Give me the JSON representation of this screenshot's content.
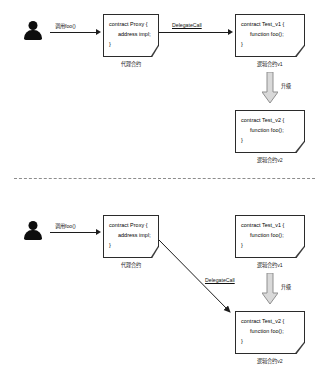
{
  "diagram": {
    "divider_label": "dashed-separator"
  },
  "panel_before": {
    "actor": {
      "name": "user-actor"
    },
    "call_label": "调用foo()",
    "proxy_box": {
      "line1": "contract Proxy {",
      "line2": "address impl;",
      "line3": "}",
      "caption": "代理合约"
    },
    "delegate_label": "DelegateCall",
    "logic_v1_box": {
      "line1": "contract Test_v1 {",
      "line2": "function foo();",
      "line3": "}",
      "caption": "逻辑合约v1"
    },
    "upgrade_label": "升级",
    "logic_v2_box": {
      "line1": "contract Test_v2 {",
      "line2": "function foo();",
      "line3": "}",
      "caption": "逻辑合约v2"
    }
  },
  "panel_after": {
    "actor": {
      "name": "user-actor"
    },
    "call_label": "调用foo()",
    "proxy_box": {
      "line1": "contract Proxy {",
      "line2": "address impl;",
      "line3": "}",
      "caption": "代理合约"
    },
    "delegate_label": "DelegateCall",
    "logic_v1_box": {
      "line1": "contract Test_v1 {",
      "line2": "function foo();",
      "line3": "}",
      "caption": "逻辑合约v1"
    },
    "upgrade_label": "升级",
    "logic_v2_box": {
      "line1": "contract Test_v2 {",
      "line2": "function foo();",
      "line3": "}",
      "caption": "逻辑合约v2"
    }
  },
  "colors": {
    "stroke": "#2b2b2b",
    "arrow": "#1c1c1c",
    "block_arrow_fill": "#d9d9d9",
    "block_arrow_stroke": "#8f8f8f",
    "divider": "#7a7a7a",
    "background": "#ffffff"
  }
}
